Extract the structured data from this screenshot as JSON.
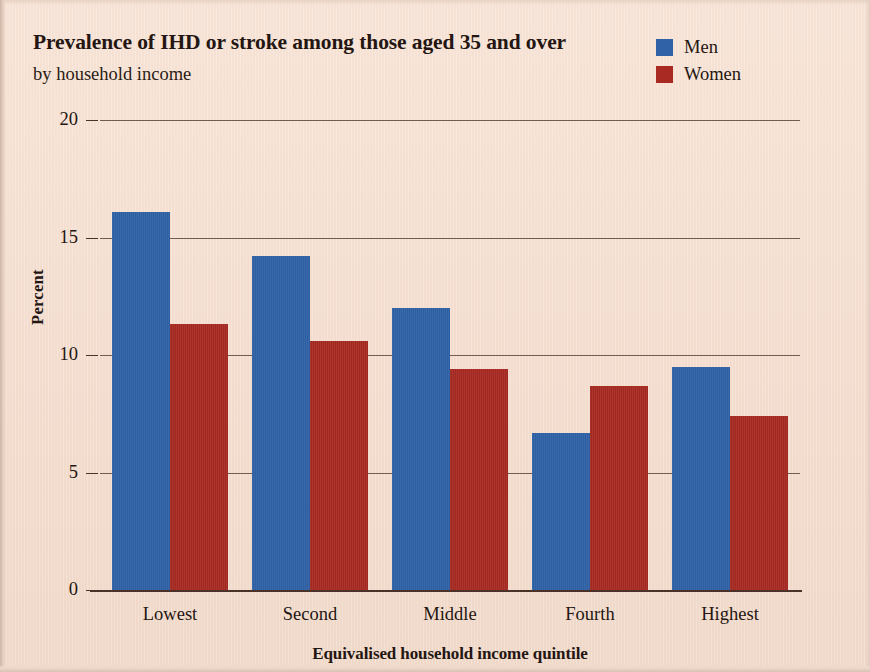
{
  "chart_data": {
    "type": "bar",
    "title": "Prevalence of IHD or stroke among those aged 35 and over",
    "subtitle": "by household income",
    "xlabel": "Equivalised household income quintile",
    "ylabel": "Percent",
    "categories": [
      "Lowest",
      "Second",
      "Middle",
      "Fourth",
      "Highest"
    ],
    "series": [
      {
        "name": "Men",
        "color": "#2f62a6",
        "values": [
          16.1,
          14.2,
          12.0,
          6.7,
          9.5
        ]
      },
      {
        "name": "Women",
        "color": "#a82a22",
        "values": [
          11.3,
          10.6,
          9.4,
          8.7,
          7.4
        ]
      }
    ],
    "ylim": [
      0,
      20
    ],
    "yticks": [
      0,
      5,
      10,
      15,
      20
    ],
    "ytick_labels": [
      "0",
      "5",
      "10",
      "15",
      "20"
    ],
    "grid": "horizontal",
    "legend_position": "top-right"
  },
  "colors": {
    "background": "#f3dccd",
    "text": "#241612",
    "grid": "#5c4438",
    "axis": "#4a3228"
  }
}
